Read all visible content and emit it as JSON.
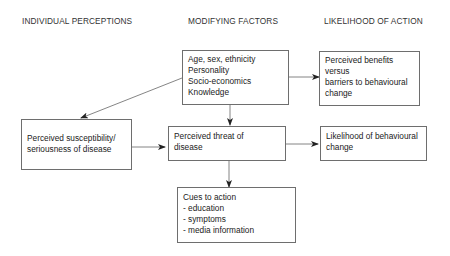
{
  "headers": {
    "individual": "INDIVIDUAL PERCEPTIONS",
    "modifying": "MODIFYING FACTORS",
    "likelihood": "LIKELIHOOD OF ACTION"
  },
  "nodes": {
    "modifying_factors": {
      "lines": [
        "Age, sex, ethnicity",
        "Personality",
        "Socio-economics",
        "Knowledge"
      ]
    },
    "perceived_benefits": {
      "lines": [
        "Perceived benefits",
        "versus",
        "barriers to behavioural",
        "change"
      ]
    },
    "perceived_susceptibility": {
      "lines": [
        "Perceived susceptibility/",
        "seriousness of disease"
      ]
    },
    "perceived_threat": {
      "lines": [
        "Perceived threat of",
        "disease"
      ]
    },
    "likelihood_change": {
      "lines": [
        "Likelihood of behavioural",
        "change"
      ]
    },
    "cues_to_action": {
      "lines": [
        "Cues to action",
        "- education",
        "- symptoms",
        "- media information"
      ]
    }
  },
  "edges": [
    {
      "from": "modifying_factors",
      "to": "perceived_susceptibility"
    },
    {
      "from": "modifying_factors",
      "to": "perceived_benefits"
    },
    {
      "from": "modifying_factors",
      "to": "perceived_threat"
    },
    {
      "from": "perceived_susceptibility",
      "to": "perceived_threat"
    },
    {
      "from": "perceived_threat",
      "to": "likelihood_change"
    },
    {
      "from": "perceived_threat",
      "to": "cues_to_action"
    }
  ]
}
